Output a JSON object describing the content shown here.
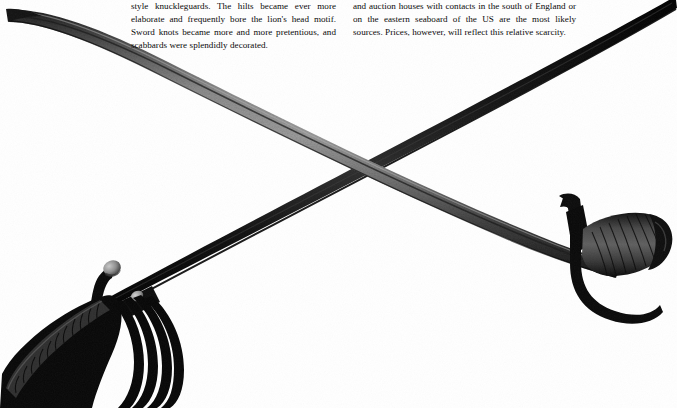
{
  "page": {
    "background_color": "#ffffff",
    "text_color": "#0a0a0a",
    "width": 677,
    "height": 408
  },
  "text_columns": {
    "left": {
      "name": "left-text-column",
      "body": "style knuckleguards. The hilts became ever more elaborate and frequently bore the lion's head motif. Sword knots became more and more pretentious, and scabbards were splendidly decorated."
    },
    "right": {
      "name": "right-text-column",
      "body": "and auction houses with contacts in the south of England or on the eastern seaboard of the US are the most likely sources. Prices, however, will reflect this relative scarcity."
    }
  },
  "illustration": {
    "name": "crossed-swords-photograph",
    "description": "Black and white photograph of two antique swords crossed in an X",
    "colors": {
      "blade_dark": "#0b0b0b",
      "blade_steel": "#6d6d6d",
      "blade_steel_light": "#9a9a9a",
      "hilt_black": "#070707",
      "pommel_grey": "#8f8f8f",
      "grip_grey": "#3a3a3a",
      "background": "#ffffff"
    },
    "objects": [
      {
        "name": "curved-sabre",
        "label": "Curved cavalry sabre with ornate basket hilt",
        "blade_tip": "upper-left",
        "hilt_position": "lower-left",
        "blade_finish": "steel"
      },
      {
        "name": "straight-sword",
        "label": "Straight sword with D-shaped knuckleguard and ribbed grip",
        "blade_tip": "upper-right",
        "hilt_position": "right",
        "blade_finish": "blackened"
      }
    ]
  }
}
